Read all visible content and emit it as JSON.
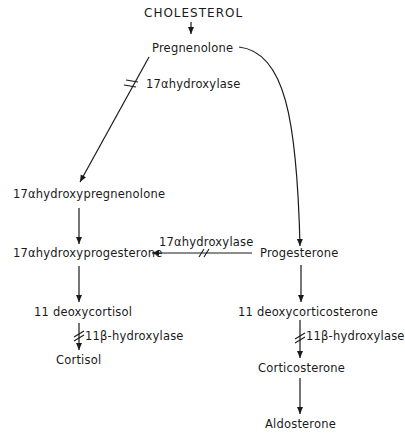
{
  "diagram": {
    "nodes": {
      "cholesterol": "CHOLESTEROL",
      "pregnenolone": "Pregnenolone",
      "hydroxypregnenolone": "17αhydroxypregnenolone",
      "hydroxyprogesterone": "17αhydroxyprogesterone",
      "progesterone": "Progesterone",
      "deoxycortisol": "11 deoxycortisol",
      "cortisol": "Cortisol",
      "deoxycorticosterone": "11 deoxycorticosterone",
      "corticosterone": "Corticosterone",
      "aldosterone": "Aldosterone"
    },
    "enzymes": {
      "hydroxylase17_top": "17αhydroxylase",
      "hydroxylase17_mid": "17αhydroxylase",
      "hydroxylase11_left": "11β-hydroxylase",
      "hydroxylase11_right": "11β-hydroxylase"
    },
    "edges": [
      {
        "from": "CHOLESTEROL",
        "to": "Pregnenolone",
        "blocked": false
      },
      {
        "from": "Pregnenolone",
        "to": "17αhydroxypregnenolone",
        "enzyme": "17αhydroxylase",
        "blocked": true
      },
      {
        "from": "Pregnenolone",
        "to": "Progesterone",
        "blocked": false
      },
      {
        "from": "17αhydroxypregnenolone",
        "to": "17αhydroxyprogesterone",
        "blocked": false
      },
      {
        "from": "Progesterone",
        "to": "17αhydroxyprogesterone",
        "enzyme": "17αhydroxylase",
        "blocked": true
      },
      {
        "from": "17αhydroxyprogesterone",
        "to": "11 deoxycortisol",
        "blocked": false
      },
      {
        "from": "11 deoxycortisol",
        "to": "Cortisol",
        "enzyme": "11β-hydroxylase",
        "blocked": true
      },
      {
        "from": "Progesterone",
        "to": "11 deoxycorticosterone",
        "blocked": false
      },
      {
        "from": "11 deoxycorticosterone",
        "to": "Corticosterone",
        "enzyme": "11β-hydroxylase",
        "blocked": true
      },
      {
        "from": "Corticosterone",
        "to": "Aldosterone",
        "blocked": false
      }
    ],
    "colors": {
      "line": "#1a1a1a",
      "background": "#ffffff"
    }
  }
}
